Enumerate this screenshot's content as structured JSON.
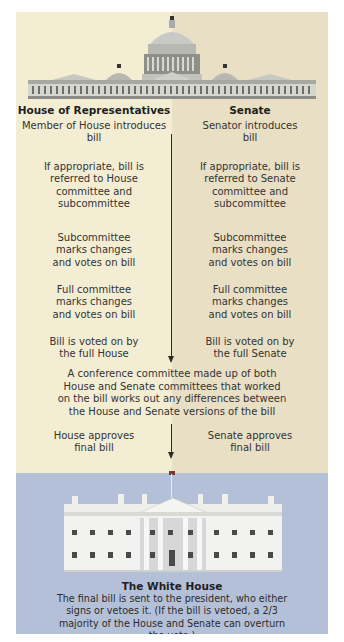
{
  "header": {
    "left_title": "House of Representatives",
    "right_title": "Senate"
  },
  "house_steps": [
    "Member of House introduces bill",
    "If appropriate, bill is referred to House committee and subcommittee",
    "Subcommittee marks changes and votes on bill",
    "Full committee marks changes and votes on bill",
    "Bill is voted on by the full House"
  ],
  "senate_steps": [
    "Senator introduces bill",
    "If appropriate, bill is referred to Senate committee and subcommittee",
    "Subcommittee marks changes and votes on bill",
    "Full committee marks changes and votes on bill",
    "Bill is voted on by the full Senate"
  ],
  "conference": {
    "text": "A conference committee made up of both House and Senate committees that worked on the bill works out any differences between the House and Senate versions of the bill"
  },
  "approvals": {
    "house": "House approves final bill",
    "senate": "Senate approves final bill"
  },
  "white_house": {
    "title": "The White House",
    "text": "The final bill is sent to the president, who either signs or vetoes it. (If the bill is vetoed, a 2/3 majority of the House and Senate can overturn the veto.)"
  },
  "icons": {
    "capitol": "capitol-building-illustration",
    "white_house": "white-house-illustration",
    "flag": "us-flag-icon",
    "arrow": "down-arrow"
  },
  "colors": {
    "house_bg": "#f3eed3",
    "senate_bg": "#e9dfc4",
    "white_house_bg": "#b4c0d8",
    "arrow": "#2b2b2b"
  }
}
